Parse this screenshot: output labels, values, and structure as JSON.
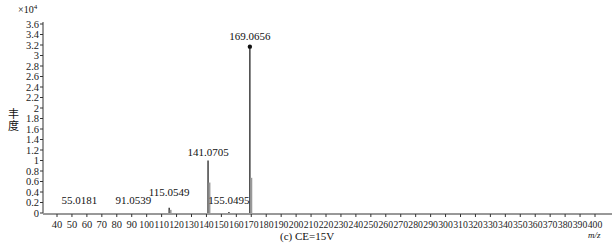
{
  "chart_data": {
    "type": "bar",
    "subtype": "mass-spectrum",
    "title": "",
    "caption": "(c) CE=15V",
    "xlabel": "m/z",
    "ylabel": "丰度",
    "y_multiplier": "×10^4",
    "xlim": [
      40,
      400
    ],
    "ylim": [
      0,
      3.6
    ],
    "x_ticks": [
      40,
      50,
      60,
      70,
      80,
      90,
      100,
      110,
      120,
      130,
      140,
      150,
      160,
      170,
      180,
      190,
      200,
      210,
      220,
      230,
      240,
      250,
      260,
      270,
      280,
      290,
      300,
      310,
      320,
      330,
      340,
      350,
      360,
      370,
      380,
      390,
      400
    ],
    "y_ticks": [
      0,
      0.2,
      0.4,
      0.6,
      0.8,
      1,
      1.2,
      1.4,
      1.6,
      1.8,
      2,
      2.2,
      2.4,
      2.6,
      2.8,
      3,
      3.2,
      3.4,
      3.6
    ],
    "grid": false,
    "series": [
      {
        "name": "measured",
        "color": "#111111",
        "peaks": [
          {
            "mz": 115.0549,
            "intensity": 0.1
          },
          {
            "mz": 141.0705,
            "intensity": 1.0
          },
          {
            "mz": 155.0495,
            "intensity": 0.02
          },
          {
            "mz": 169.0656,
            "intensity": 3.15
          }
        ]
      },
      {
        "name": "isotope",
        "color": "#999999",
        "peaks": [
          {
            "mz": 116.0,
            "intensity": 0.06
          },
          {
            "mz": 142.0,
            "intensity": 0.58
          },
          {
            "mz": 170.0,
            "intensity": 0.67
          }
        ]
      }
    ],
    "annotations": [
      {
        "text": "55.0181",
        "mz": 55.0181,
        "y": 0.18
      },
      {
        "text": "91.0539",
        "mz": 91.0539,
        "y": 0.18
      },
      {
        "text": "115.0549",
        "mz": 115.0549,
        "y": 0.32
      },
      {
        "text": "141.0705",
        "mz": 141.0705,
        "y": 1.08
      },
      {
        "text": "155.0495",
        "mz": 155.0495,
        "y": 0.18
      },
      {
        "text": "169.0656",
        "mz": 169.0656,
        "y": 3.3,
        "marker": "dot"
      }
    ]
  },
  "labels": {
    "ylabel": "丰度",
    "exp_base": "×10",
    "exp_power": "4",
    "caption": "(c) CE=15V",
    "xunit": "m/z"
  }
}
